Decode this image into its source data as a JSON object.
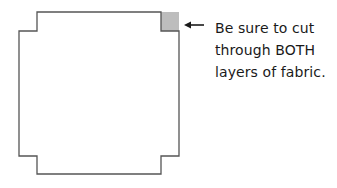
{
  "diagram": {
    "shape": {
      "description": "square with notched corners",
      "stroke_color": "#555555",
      "fill_color": "#ffffff",
      "highlighted_corner": "top-right",
      "highlight_color": "#bdbdbd"
    },
    "annotation": {
      "arrow_direction": "left",
      "arrow_color": "#1a1a1a",
      "lines": [
        "Be sure to cut",
        "through BOTH",
        "layers of fabric."
      ]
    }
  }
}
